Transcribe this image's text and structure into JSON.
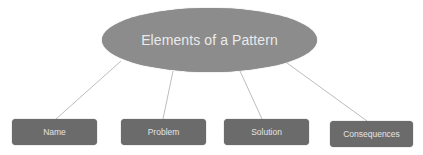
{
  "diagram": {
    "root": {
      "label": "Elements of a Pattern",
      "color": "#8c8c8c",
      "text_color": "#eaeaea"
    },
    "children": [
      {
        "label": "Name"
      },
      {
        "label": "Problem"
      },
      {
        "label": "Solution"
      },
      {
        "label": "Consequences"
      }
    ],
    "child_color": "#6b6b6b",
    "child_text_color": "#e4e4e4",
    "connector_color": "#bdbdbd"
  }
}
